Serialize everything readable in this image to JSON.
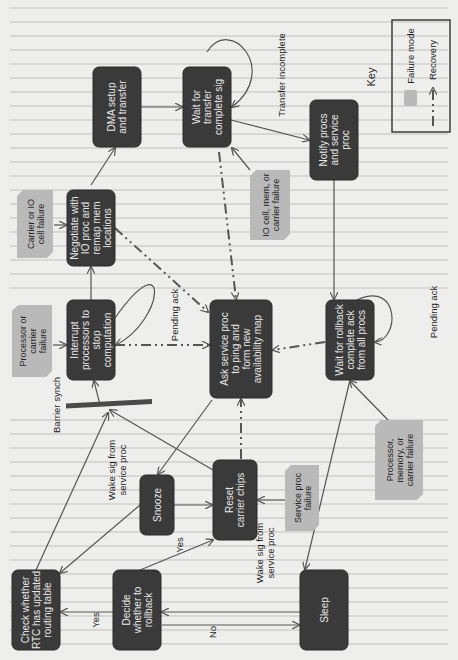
{
  "diagram": {
    "orientation": "rotated-90-ccw",
    "nodes": [
      {
        "id": "dma",
        "lines": [
          "DMA setup",
          "and transfer"
        ]
      },
      {
        "id": "wait_transfer",
        "lines": [
          "Wait for",
          "transfer",
          "complete sig"
        ]
      },
      {
        "id": "notify",
        "lines": [
          "Notify procs",
          "and service",
          "proc"
        ]
      },
      {
        "id": "negotiate",
        "lines": [
          "Negotiate with",
          "IO proc and",
          "remap mem",
          "locations"
        ]
      },
      {
        "id": "interrupt",
        "lines": [
          "Interrupt",
          "processors to",
          "stop",
          "computation"
        ]
      },
      {
        "id": "ask_service",
        "lines": [
          "Ask service proc",
          "to ping and",
          "form new",
          "availability map"
        ]
      },
      {
        "id": "wait_rollback",
        "lines": [
          "Wait for rollback",
          "complete ack",
          "from all procs"
        ]
      },
      {
        "id": "snooze",
        "lines": [
          "Snooze"
        ]
      },
      {
        "id": "reset",
        "lines": [
          "Reset",
          "carrier chips"
        ]
      },
      {
        "id": "check_rtc",
        "lines": [
          "Check whether",
          "RTC has updated",
          "routing table"
        ]
      },
      {
        "id": "decide",
        "lines": [
          "Decide",
          "whether to",
          "rollback"
        ]
      },
      {
        "id": "sleep",
        "lines": [
          "Sleep"
        ]
      }
    ],
    "failure_modes": [
      {
        "id": "carrier_io",
        "lines": [
          "Carrier or IO",
          "cell failure"
        ]
      },
      {
        "id": "proc_carrier",
        "lines": [
          "Processor or",
          "carrier",
          "failure"
        ]
      },
      {
        "id": "io_mem",
        "lines": [
          "IO cell, mem, or",
          "carrier failure"
        ]
      },
      {
        "id": "service_proc",
        "lines": [
          "Service proc",
          "failure"
        ]
      },
      {
        "id": "proc_mem_carrier",
        "lines": [
          "Processor,",
          "memory, or",
          "carrier failure"
        ]
      }
    ],
    "edge_labels": {
      "transfer_incomplete": "Transfer incomplete",
      "pending_ack_1": "Pending ack",
      "pending_ack_2": "Pending ack",
      "barrier_synch": "Barrier synch",
      "wake_sig_1": [
        "Wake sig from",
        "service proc"
      ],
      "wake_sig_2": [
        "Wake sig from",
        "service proc"
      ],
      "yes_1": "Yes",
      "yes_2": "Yes",
      "no": "No"
    },
    "key": {
      "title": "Key",
      "failure_mode": "Failure mode",
      "recovery": "Recovery"
    }
  }
}
